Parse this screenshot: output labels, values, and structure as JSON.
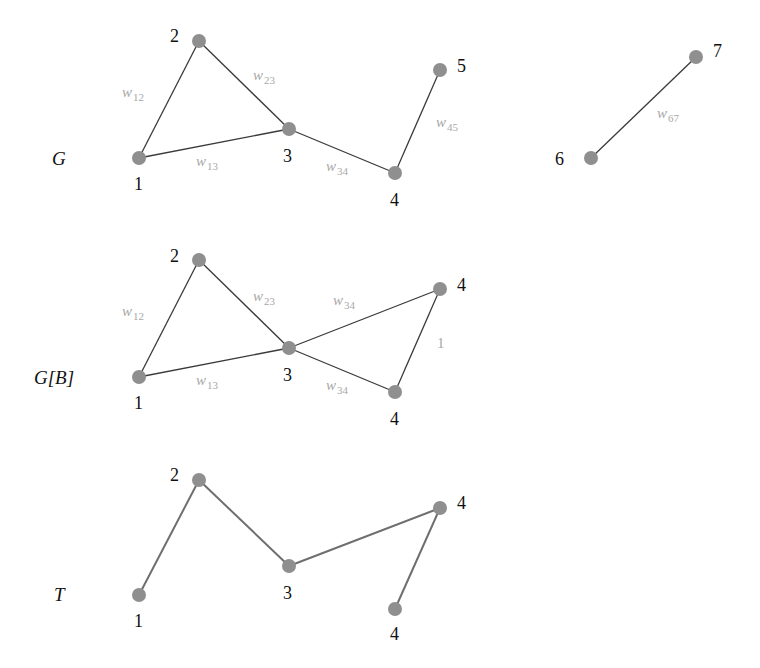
{
  "panels": [
    {
      "id": "G",
      "label": "G",
      "label_pos": [
        52,
        165
      ],
      "edge_style": "edge",
      "nodes": [
        {
          "id": "1",
          "label": "1",
          "x": 139,
          "y": 158,
          "lx": 134,
          "ly": 190
        },
        {
          "id": "2",
          "label": "2",
          "x": 199,
          "y": 41,
          "lx": 170,
          "ly": 42
        },
        {
          "id": "3",
          "label": "3",
          "x": 289,
          "y": 129,
          "lx": 283,
          "ly": 162
        },
        {
          "id": "4",
          "label": "4",
          "x": 395,
          "y": 173,
          "lx": 390,
          "ly": 206
        },
        {
          "id": "5",
          "label": "5",
          "x": 440,
          "y": 70,
          "lx": 457,
          "ly": 72
        },
        {
          "id": "6",
          "label": "6",
          "x": 591,
          "y": 158,
          "lx": 555,
          "ly": 165
        },
        {
          "id": "7",
          "label": "7",
          "x": 696,
          "y": 57,
          "lx": 713,
          "ly": 57
        }
      ],
      "edges": [
        {
          "from": "1",
          "to": "2",
          "weight": "w",
          "sub": "12",
          "wx": 122,
          "wy": 97
        },
        {
          "from": "2",
          "to": "3",
          "weight": "w",
          "sub": "23",
          "wx": 253,
          "wy": 80
        },
        {
          "from": "1",
          "to": "3",
          "weight": "w",
          "sub": "13",
          "wx": 196,
          "wy": 166
        },
        {
          "from": "3",
          "to": "4",
          "weight": "w",
          "sub": "34",
          "wx": 326,
          "wy": 171
        },
        {
          "from": "4",
          "to": "5",
          "weight": "w",
          "sub": "45",
          "wx": 436,
          "wy": 127
        },
        {
          "from": "6",
          "to": "7",
          "weight": "w",
          "sub": "67",
          "wx": 657,
          "wy": 118
        }
      ]
    },
    {
      "id": "GB",
      "label": "G[B]",
      "label_pos": [
        34,
        384
      ],
      "edge_style": "edge",
      "nodes": [
        {
          "id": "1",
          "label": "1",
          "x": 139,
          "y": 377,
          "lx": 134,
          "ly": 409
        },
        {
          "id": "2",
          "label": "2",
          "x": 199,
          "y": 260,
          "lx": 170,
          "ly": 262
        },
        {
          "id": "3",
          "label": "3",
          "x": 289,
          "y": 348,
          "lx": 283,
          "ly": 381
        },
        {
          "id": "4a",
          "label": "4",
          "x": 440,
          "y": 289,
          "lx": 457,
          "ly": 291
        },
        {
          "id": "4b",
          "label": "4",
          "x": 395,
          "y": 392,
          "lx": 390,
          "ly": 425
        }
      ],
      "edges": [
        {
          "from": "1",
          "to": "2",
          "weight": "w",
          "sub": "12",
          "wx": 122,
          "wy": 316
        },
        {
          "from": "2",
          "to": "3",
          "weight": "w",
          "sub": "23",
          "wx": 253,
          "wy": 301
        },
        {
          "from": "1",
          "to": "3",
          "weight": "w",
          "sub": "13",
          "wx": 196,
          "wy": 385
        },
        {
          "from": "3",
          "to": "4a",
          "weight": "w",
          "sub": "34",
          "wx": 333,
          "wy": 305
        },
        {
          "from": "3",
          "to": "4b",
          "weight": "w",
          "sub": "34",
          "wx": 326,
          "wy": 390
        },
        {
          "from": "4a",
          "to": "4b",
          "weight": "1",
          "sub": "",
          "wx": 437,
          "wy": 348
        }
      ]
    },
    {
      "id": "T",
      "label": "T",
      "label_pos": [
        54,
        601
      ],
      "edge_style": "edge-t",
      "nodes": [
        {
          "id": "1",
          "label": "1",
          "x": 139,
          "y": 595,
          "lx": 134,
          "ly": 627
        },
        {
          "id": "2",
          "label": "2",
          "x": 199,
          "y": 480,
          "lx": 170,
          "ly": 481
        },
        {
          "id": "3",
          "label": "3",
          "x": 289,
          "y": 566,
          "lx": 283,
          "ly": 599
        },
        {
          "id": "4a",
          "label": "4",
          "x": 440,
          "y": 508,
          "lx": 457,
          "ly": 509
        },
        {
          "id": "4b",
          "label": "4",
          "x": 395,
          "y": 609,
          "lx": 390,
          "ly": 640
        }
      ],
      "edges": [
        {
          "from": "1",
          "to": "2",
          "weight": "",
          "sub": ""
        },
        {
          "from": "2",
          "to": "3",
          "weight": "",
          "sub": ""
        },
        {
          "from": "3",
          "to": "4a",
          "weight": "",
          "sub": ""
        },
        {
          "from": "4a",
          "to": "4b",
          "weight": "",
          "sub": ""
        }
      ]
    }
  ],
  "colors": {
    "node_fill": "#8f8f8f",
    "edge": "#3a3a3a",
    "tree_edge": "#6e6e6e",
    "weight_label": "#a8a8a8",
    "text": "#111111"
  }
}
